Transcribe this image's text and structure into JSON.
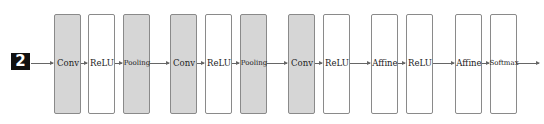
{
  "diagram": {
    "input": {
      "label": "2"
    },
    "layers": [
      {
        "label": "Conv",
        "style": "gray",
        "x": 54
      },
      {
        "label": "ReLU",
        "style": "white",
        "x": 88
      },
      {
        "label": "Pooling",
        "style": "gray",
        "x": 123
      },
      {
        "label": "Conv",
        "style": "gray",
        "x": 170
      },
      {
        "label": "ReLU",
        "style": "white",
        "x": 205
      },
      {
        "label": "Pooling",
        "style": "gray",
        "x": 240
      },
      {
        "label": "Conv",
        "style": "gray",
        "x": 288
      },
      {
        "label": "ReLU",
        "style": "white",
        "x": 323
      },
      {
        "label": "Affine",
        "style": "white",
        "x": 371
      },
      {
        "label": "ReLU",
        "style": "white",
        "x": 406
      },
      {
        "label": "Affine",
        "style": "white",
        "x": 455
      },
      {
        "label": "Softmax",
        "style": "white",
        "x": 490
      }
    ],
    "colors": {
      "conv_pool_fill": "#d6d6d6",
      "other_fill": "#ffffff",
      "border": "#8a8a8a"
    }
  }
}
